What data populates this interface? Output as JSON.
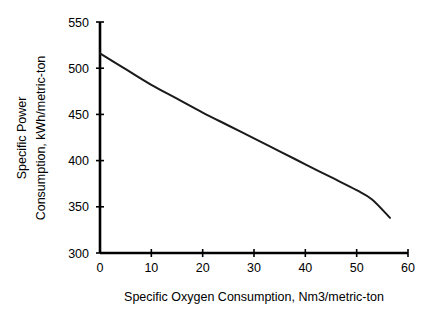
{
  "chart_data": {
    "type": "line",
    "title": "",
    "xlabel": "Specific Oxygen Consumption, Nm3/metric-ton",
    "ylabel_line1": "Specific Power",
    "ylabel_line2": "Consumption, kWh/metric-ton",
    "xlim": [
      0,
      60
    ],
    "ylim": [
      300,
      550
    ],
    "xticks": [
      0,
      10,
      20,
      30,
      40,
      50,
      60
    ],
    "xtick_labels": [
      "0",
      "10",
      "20",
      "30",
      "40",
      "50",
      "60"
    ],
    "yticks": [
      300,
      350,
      400,
      450,
      500,
      550
    ],
    "ytick_labels": [
      "300",
      "350",
      "400",
      "450",
      "500",
      "550"
    ],
    "grid": false,
    "legend": false,
    "series": [
      {
        "name": "Specific Power Consumption",
        "color": "#1a1a1a",
        "x": [
          0,
          5,
          10,
          15,
          20,
          25,
          30,
          35,
          40,
          45,
          50,
          53,
          56.5
        ],
        "values": [
          516,
          499,
          482,
          467,
          452,
          438,
          424,
          410,
          396,
          382,
          368,
          358,
          338
        ]
      }
    ]
  },
  "labels": {
    "y_axis_line1": "Specific Power",
    "y_axis_line2": "Consumption, kWh/metric-ton",
    "x_axis": "Specific Oxygen Consumption, Nm3/metric-ton"
  }
}
